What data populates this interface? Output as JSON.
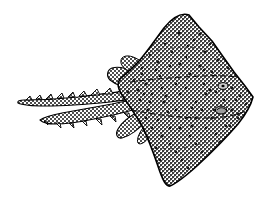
{
  "image": {
    "subject": "skate-ray-fish",
    "caption": "Line drawing of a skate (ray) seen from above, with stippled halftone shading",
    "style": "black-and-white-line-art-halftone",
    "background_color": "#ffffff",
    "outline_color": "#000000",
    "fill_tone_color": "#8a8a8a",
    "width": 268,
    "height": 202
  },
  "anatomy": {
    "parts": [
      {
        "name": "disc-body",
        "label": "Disc (fused pectoral fins)"
      },
      {
        "name": "snout",
        "label": "Pointed snout / rostrum"
      },
      {
        "name": "upper-wing",
        "label": "Upper pectoral wing"
      },
      {
        "name": "lower-wing",
        "label": "Lower pectoral wing"
      },
      {
        "name": "pelvic-fin-upper",
        "label": "Upper pelvic fin"
      },
      {
        "name": "pelvic-fin-lower",
        "label": "Lower pelvic fin"
      },
      {
        "name": "tail",
        "label": "Long spiny tail"
      },
      {
        "name": "eye",
        "label": "Eye"
      },
      {
        "name": "spiracle",
        "label": "Spiracle"
      }
    ]
  },
  "geometry": {
    "disc_outline": "M 253 97 L 232 70 L 216 47 L 200 26 L 186 14 L 172 20 L 158 36 L 146 52 L 136 62 L 126 70 L 120 78 L 122 88 L 128 98 L 138 112 L 150 134 L 158 156 L 164 176 L 169 185 L 180 180 L 196 166 L 212 150 L 228 134 L 242 118 L 251 106 Z",
    "upper_wing_edge": "M 186 14 C 171 17 160 32 150 47 C 141 60 132 68 122 76",
    "lower_wing_edge": "M 122 86 C 132 96 142 112 150 132 C 158 152 163 172 168 185",
    "tail_main": "M 130 95 C 112 96 92 98 72 100 C 56 102 38 102 20 101",
    "tail_lower": "M 136 104 C 120 108 100 112 80 116 C 66 119 54 120 44 120",
    "inner_line_upper": "M 134 84 C 155 82 180 80 204 78 C 220 77 234 77 244 79",
    "inner_line_lower": "M 136 110 C 158 114 182 116 206 116 C 222 116 236 114 246 110",
    "eye_center": [
      222,
      86
    ],
    "spiracle_center": [
      221,
      110
    ],
    "snout_tip": [
      253,
      97
    ],
    "tail_tip": [
      19,
      101
    ],
    "upper_wing_peak": [
      186,
      14
    ],
    "lower_wing_tip": [
      167,
      185
    ]
  },
  "texture": {
    "type": "crosshatch-halftone",
    "cell_size_px": 2,
    "tone_light": "#c8c8c8",
    "tone_dark": "#4a4a4a",
    "spot_color": "#1a1a1a",
    "spot_count": 92
  },
  "spots": [
    [
      179,
      33
    ],
    [
      194,
      40
    ],
    [
      165,
      44
    ],
    [
      205,
      52
    ],
    [
      150,
      55
    ],
    [
      186,
      57
    ],
    [
      218,
      60
    ],
    [
      142,
      68
    ],
    [
      170,
      66
    ],
    [
      200,
      66
    ],
    [
      228,
      68
    ],
    [
      160,
      76
    ],
    [
      190,
      74
    ],
    [
      212,
      72
    ],
    [
      236,
      76
    ],
    [
      146,
      84
    ],
    [
      176,
      84
    ],
    [
      204,
      84
    ],
    [
      232,
      88
    ],
    [
      152,
      94
    ],
    [
      180,
      94
    ],
    [
      206,
      94
    ],
    [
      240,
      96
    ],
    [
      140,
      100
    ],
    [
      164,
      102
    ],
    [
      196,
      102
    ],
    [
      224,
      100
    ],
    [
      148,
      110
    ],
    [
      176,
      110
    ],
    [
      202,
      110
    ],
    [
      232,
      110
    ],
    [
      158,
      120
    ],
    [
      186,
      118
    ],
    [
      212,
      118
    ],
    [
      238,
      118
    ],
    [
      152,
      128
    ],
    [
      180,
      128
    ],
    [
      206,
      128
    ],
    [
      230,
      126
    ],
    [
      162,
      136
    ],
    [
      190,
      136
    ],
    [
      216,
      134
    ],
    [
      238,
      132
    ],
    [
      170,
      144
    ],
    [
      196,
      144
    ],
    [
      220,
      142
    ],
    [
      176,
      152
    ],
    [
      202,
      152
    ],
    [
      224,
      150
    ],
    [
      182,
      160
    ],
    [
      206,
      160
    ],
    [
      214,
      158
    ],
    [
      188,
      168
    ],
    [
      198,
      170
    ],
    [
      172,
      170
    ],
    [
      160,
      160
    ],
    [
      156,
      148
    ],
    [
      148,
      138
    ],
    [
      138,
      124
    ],
    [
      132,
      112
    ],
    [
      128,
      92
    ],
    [
      134,
      80
    ],
    [
      142,
      74
    ],
    [
      158,
      62
    ],
    [
      172,
      52
    ],
    [
      188,
      46
    ],
    [
      200,
      34
    ],
    [
      210,
      44
    ],
    [
      222,
      54
    ],
    [
      234,
      64
    ],
    [
      244,
      82
    ],
    [
      246,
      104
    ],
    [
      238,
      114
    ],
    [
      226,
      126
    ],
    [
      214,
      110
    ],
    [
      196,
      118
    ],
    [
      168,
      112
    ],
    [
      150,
      102
    ],
    [
      138,
      90
    ],
    [
      162,
      88
    ],
    [
      186,
      88
    ],
    [
      210,
      90
    ],
    [
      236,
      100
    ],
    [
      192,
      108
    ],
    [
      166,
      96
    ],
    [
      144,
      94
    ],
    [
      204,
      70
    ],
    [
      180,
      64
    ],
    [
      156,
      70
    ],
    [
      216,
      92
    ],
    [
      192,
      126
    ],
    [
      170,
      128
    ],
    [
      146,
      118
    ]
  ],
  "tail_spines": {
    "upper_count": 14,
    "lower_count": 11
  }
}
